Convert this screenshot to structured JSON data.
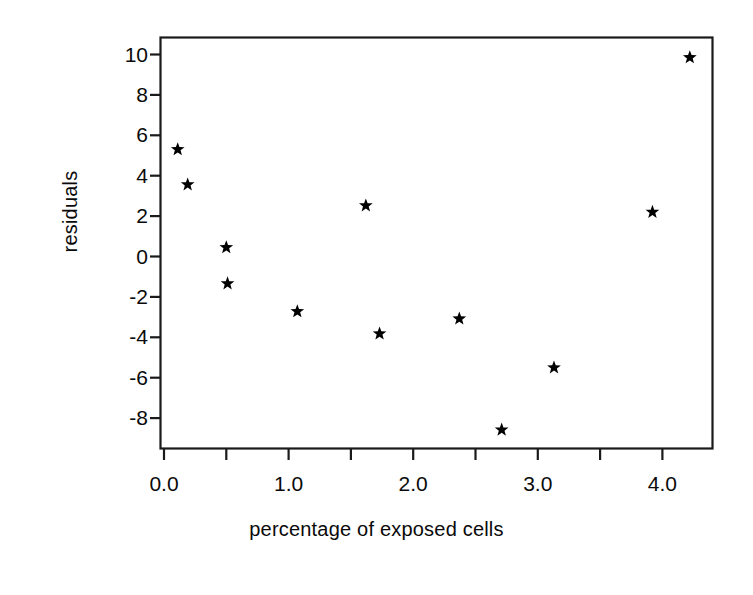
{
  "chart_data": {
    "type": "scatter",
    "title": "",
    "xlabel": "percentage of exposed cells",
    "ylabel": "residuals",
    "xlim": [
      -0.15,
      4.4
    ],
    "ylim": [
      -9.6,
      10.6
    ],
    "grid": false,
    "legend": null,
    "marker": "star",
    "marker_color": "#000000",
    "x_major_ticks": [
      "0.0",
      "1.0",
      "2.0",
      "3.0",
      "4.0"
    ],
    "x_major_values": [
      0.0,
      1.0,
      2.0,
      3.0,
      4.0
    ],
    "x_minor_values": [
      0.5,
      1.5,
      2.5,
      3.5
    ],
    "y_ticks": [
      "10",
      "8",
      "6",
      "4",
      "2",
      "0",
      "-2",
      "-4",
      "-6",
      "-8"
    ],
    "y_values": [
      10,
      8,
      6,
      4,
      2,
      0,
      -2,
      -4,
      -6,
      -8
    ],
    "points": [
      {
        "x": 0.11,
        "y": 5.3
      },
      {
        "x": 0.19,
        "y": 3.56
      },
      {
        "x": 0.5,
        "y": 0.45
      },
      {
        "x": 0.51,
        "y": -1.34
      },
      {
        "x": 1.07,
        "y": -2.72
      },
      {
        "x": 1.62,
        "y": 2.52
      },
      {
        "x": 1.73,
        "y": -3.82
      },
      {
        "x": 2.37,
        "y": -3.08
      },
      {
        "x": 2.71,
        "y": -8.58
      },
      {
        "x": 3.13,
        "y": -5.5
      },
      {
        "x": 3.92,
        "y": 2.2
      },
      {
        "x": 4.22,
        "y": 9.85
      }
    ]
  },
  "figure": {
    "background": "#ffffff",
    "axis_color": "#1a1a1a",
    "text_color": "#0a0a0a"
  }
}
